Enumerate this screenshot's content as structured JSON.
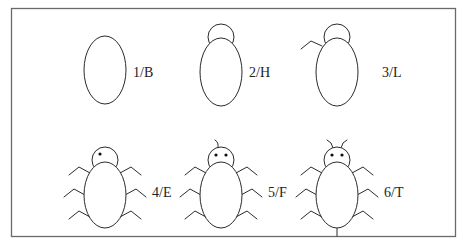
{
  "figure": {
    "colors": {
      "stroke": "#2b2b2b",
      "frame": "#6a6a6a",
      "background": "#ffffff"
    },
    "stages": [
      {
        "label": "1/B",
        "parts": [
          "body"
        ]
      },
      {
        "label": "2/H",
        "parts": [
          "body",
          "head"
        ]
      },
      {
        "label": "3/L",
        "parts": [
          "body",
          "head",
          "one-leg"
        ]
      },
      {
        "label": "4/E",
        "parts": [
          "body",
          "head",
          "six-legs",
          "one-eye"
        ]
      },
      {
        "label": "5/F",
        "parts": [
          "body",
          "head",
          "six-legs",
          "two-eyes",
          "one-antenna"
        ]
      },
      {
        "label": "6/T",
        "parts": [
          "body",
          "head",
          "six-legs",
          "two-eyes",
          "two-antennae",
          "tail"
        ]
      }
    ]
  }
}
